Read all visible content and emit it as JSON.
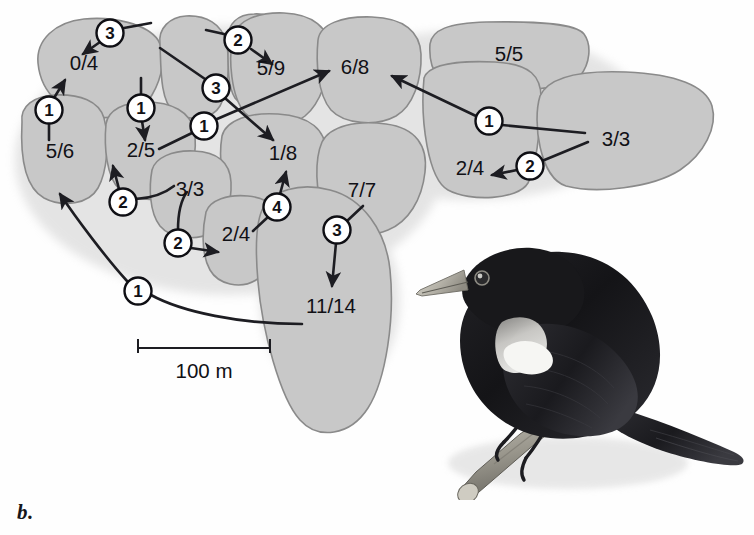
{
  "figure": {
    "panel_label": "b.",
    "caption_subject": "red-winged-blackbird-territory-map"
  },
  "scale": {
    "label": "100 m",
    "bar_length_px": 132,
    "x1": 138,
    "x2": 270,
    "y": 348
  },
  "legend_note": "numbers in territories are successful/total nests; circled numbers are number of females",
  "territories": [
    {
      "id": "t-0-4",
      "label": "0/4",
      "x": 84,
      "y": 65
    },
    {
      "id": "t-5-6",
      "label": "5/6",
      "x": 60,
      "y": 153
    },
    {
      "id": "t-2-5",
      "label": "2/5",
      "x": 141,
      "y": 152
    },
    {
      "id": "t-5-9",
      "label": "5/9",
      "x": 271,
      "y": 70
    },
    {
      "id": "t-6-8",
      "label": "6/8",
      "x": 355,
      "y": 69
    },
    {
      "id": "t-5-5",
      "label": "5/5",
      "x": 509,
      "y": 56
    },
    {
      "id": "t-3-3r",
      "label": "3/3",
      "x": 616,
      "y": 141
    },
    {
      "id": "t-2-4r",
      "label": "2/4",
      "x": 470,
      "y": 170
    },
    {
      "id": "t-1-8",
      "label": "1/8",
      "x": 283,
      "y": 155
    },
    {
      "id": "t-3-3l",
      "label": "3/3",
      "x": 190,
      "y": 191
    },
    {
      "id": "t-2-4c",
      "label": "2/4",
      "x": 236,
      "y": 236
    },
    {
      "id": "t-7-7",
      "label": "7/7",
      "x": 362,
      "y": 192
    },
    {
      "id": "t-11-14",
      "label": "11/14",
      "x": 331,
      "y": 308
    }
  ],
  "markers": [
    {
      "id": "m-a",
      "value": "3",
      "cx": 110,
      "cy": 33
    },
    {
      "id": "m-b",
      "value": "2",
      "cx": 238,
      "cy": 40
    },
    {
      "id": "m-c",
      "value": "3",
      "cx": 216,
      "cy": 88
    },
    {
      "id": "m-d",
      "value": "1",
      "cx": 49,
      "cy": 110
    },
    {
      "id": "m-e",
      "value": "1",
      "cx": 141,
      "cy": 108
    },
    {
      "id": "m-f",
      "value": "1",
      "cx": 204,
      "cy": 126
    },
    {
      "id": "m-g",
      "value": "1",
      "cx": 489,
      "cy": 121
    },
    {
      "id": "m-h",
      "value": "2",
      "cx": 530,
      "cy": 166
    },
    {
      "id": "m-i",
      "value": "2",
      "cx": 123,
      "cy": 202
    },
    {
      "id": "m-j",
      "value": "4",
      "cx": 277,
      "cy": 207
    },
    {
      "id": "m-k",
      "value": "2",
      "cx": 178,
      "cy": 243
    },
    {
      "id": "m-l",
      "value": "3",
      "cx": 337,
      "cy": 230
    },
    {
      "id": "m-m",
      "value": "1",
      "cx": 138,
      "cy": 291
    }
  ],
  "bird": {
    "species": "Red-winged Blackbird",
    "plumage": "black body with pale shoulder patch",
    "perch": "cut branch"
  },
  "colors": {
    "territory_fill": "#c8c8c8",
    "territory_stroke": "#8a8a8a",
    "ink": "#1d1d22",
    "marker_fill": "#ffffff",
    "background": "#fefefe",
    "bird_body": "#161618",
    "bird_patch": "#f2f2f0",
    "bird_beak": "#b9b7ae",
    "branch": "#9b9890"
  }
}
